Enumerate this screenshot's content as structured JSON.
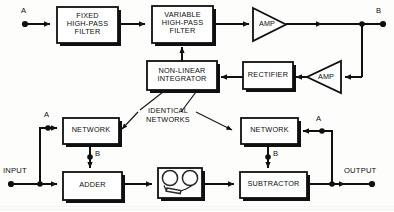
{
  "diagram": {
    "stroke_color": "#101010",
    "background_color": "#fdfdfc",
    "blocks": [
      {
        "id": "fixed_hpf",
        "label": "FIXED\nHIGH-PASS\nFILTER",
        "x": 57,
        "y": 7,
        "w": 61,
        "h": 36
      },
      {
        "id": "variable_hpf",
        "label": "VARIABLE\nHIGH-PASS\nFILTER",
        "x": 152,
        "y": 6,
        "w": 61,
        "h": 37
      },
      {
        "id": "nonlinear",
        "label": "NON-LINEAR\nINTEGRATOR",
        "x": 147,
        "y": 61,
        "w": 70,
        "h": 29
      },
      {
        "id": "rectifier",
        "label": "RECTIFIER",
        "x": 243,
        "y": 62,
        "w": 50,
        "h": 27
      },
      {
        "id": "network_left",
        "label": "NETWORK",
        "x": 63,
        "y": 118,
        "w": 56,
        "h": 26
      },
      {
        "id": "network_right",
        "label": "NETWORK",
        "x": 241,
        "y": 118,
        "w": 57,
        "h": 26
      },
      {
        "id": "adder",
        "label": "ADDER",
        "x": 63,
        "y": 172,
        "w": 59,
        "h": 28
      },
      {
        "id": "tape",
        "label": "",
        "x": 158,
        "y": 168,
        "w": 44,
        "h": 30
      },
      {
        "id": "subtractor",
        "label": "SUBTRACTOR",
        "x": 240,
        "y": 172,
        "w": 67,
        "h": 26
      }
    ],
    "amplifiers": [
      {
        "id": "amp_top",
        "label": "AMP",
        "x": 253,
        "y": 8,
        "w": 33,
        "h": 33,
        "direction": "right"
      },
      {
        "id": "amp_feedback",
        "label": "AMP",
        "x": 307,
        "y": 61,
        "w": 34,
        "h": 32,
        "direction": "left"
      }
    ],
    "terminals": [
      {
        "id": "terminal_a_top",
        "label": "A",
        "dot_x": 25,
        "dot_y": 24,
        "label_x": 21,
        "label_y": 9
      },
      {
        "id": "terminal_b_top",
        "label": "B",
        "dot_x": 383,
        "dot_y": 24,
        "label_x": 376,
        "label_y": 9
      },
      {
        "id": "terminal_input",
        "label": "INPUT",
        "dot_x": 11,
        "dot_y": 184,
        "label_x": 3,
        "label_y": 168
      },
      {
        "id": "terminal_output",
        "label": "OUTPUT",
        "dot_x": 372,
        "dot_y": 184,
        "label_x": 345,
        "label_y": 168
      },
      {
        "id": "tap_a_left",
        "label": "A",
        "dot_x": 48,
        "dot_y": 128,
        "label_x": 44,
        "label_y": 113
      },
      {
        "id": "tap_b_left",
        "label": "B",
        "dot_x": 90,
        "dot_y": 157,
        "label_x": 95,
        "label_y": 150
      },
      {
        "id": "tap_a_right",
        "label": "A",
        "dot_x": 322,
        "dot_y": 131,
        "label_x": 316,
        "label_y": 117
      },
      {
        "id": "tap_b_right",
        "label": "B",
        "dot_x": 268,
        "dot_y": 157,
        "label_x": 273,
        "label_y": 150
      }
    ],
    "annotations": [
      {
        "id": "identical_networks",
        "label": "IDENTICAL\nNETWORKS",
        "x": 140,
        "y": 110
      }
    ],
    "signal_flow": {
      "upper_path": "A → FIXED HIGH-PASS FILTER → VARIABLE HIGH-PASS FILTER → AMP → B",
      "feedback_path": "B → AMP → RECTIFIER → NON-LINEAR INTEGRATOR → VARIABLE HIGH-PASS FILTER",
      "lower_path": "INPUT → ADDER → TAPE → SUBTRACTOR → OUTPUT",
      "network_left_path": "INPUT → NETWORK (A in, B out) → ADDER",
      "network_right_path": "OUTPUT → NETWORK (A in, B out) → SUBTRACTOR"
    }
  }
}
